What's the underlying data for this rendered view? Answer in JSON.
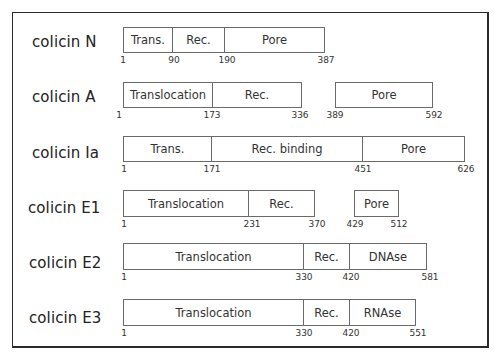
{
  "figure": {
    "rows": [
      {
        "label": "colicin N",
        "label_pos": {
          "x": 32,
          "y": 33
        },
        "box_top": 27,
        "box_height": 26,
        "segments": [
          {
            "label": "Trans.",
            "x": 123,
            "w": 50
          },
          {
            "label": "Rec.",
            "x": 172,
            "w": 53
          },
          {
            "label": "Pore",
            "x": 224,
            "w": 101
          }
        ],
        "ticks": [
          {
            "text": "1",
            "x": 123
          },
          {
            "text": "90",
            "x": 174
          },
          {
            "text": "190",
            "x": 227
          },
          {
            "text": "387",
            "x": 326
          }
        ]
      },
      {
        "label": "colicin A",
        "label_pos": {
          "x": 32,
          "y": 88
        },
        "box_top": 82,
        "box_height": 26,
        "segments": [
          {
            "label": "Translocation",
            "x": 123,
            "w": 90
          },
          {
            "label": "Rec.",
            "x": 212,
            "w": 90
          },
          {
            "label": "Pore",
            "x": 335,
            "w": 98
          }
        ],
        "ticks": [
          {
            "text": "1",
            "x": 119
          },
          {
            "text": "173",
            "x": 212
          },
          {
            "text": "336",
            "x": 300
          },
          {
            "text": "389",
            "x": 335
          },
          {
            "text": "592",
            "x": 434
          }
        ]
      },
      {
        "label": "colicin Ia",
        "label_pos": {
          "x": 32,
          "y": 144
        },
        "box_top": 136,
        "box_height": 26,
        "segments": [
          {
            "label": "Trans.",
            "x": 123,
            "w": 89
          },
          {
            "label": "Rec. binding",
            "x": 211,
            "w": 152
          },
          {
            "label": "Pore",
            "x": 362,
            "w": 103
          }
        ],
        "ticks": [
          {
            "text": "1",
            "x": 124
          },
          {
            "text": "171",
            "x": 212
          },
          {
            "text": "451",
            "x": 363
          },
          {
            "text": "626",
            "x": 466
          }
        ]
      },
      {
        "label": "colicin E1",
        "label_pos": {
          "x": 28,
          "y": 199
        },
        "box_top": 190,
        "box_height": 27,
        "segments": [
          {
            "label": "Translocation",
            "x": 123,
            "w": 126
          },
          {
            "label": "Rec.",
            "x": 248,
            "w": 67
          },
          {
            "label": "Pore",
            "x": 354,
            "w": 45
          }
        ],
        "ticks": [
          {
            "text": "1",
            "x": 124
          },
          {
            "text": "231",
            "x": 252
          },
          {
            "text": "370",
            "x": 317
          },
          {
            "text": "429",
            "x": 355
          },
          {
            "text": "512",
            "x": 399
          }
        ]
      },
      {
        "label": "colicin E2",
        "label_pos": {
          "x": 29,
          "y": 254
        },
        "box_top": 243,
        "box_height": 27,
        "segments": [
          {
            "label": "Translocation",
            "x": 123,
            "w": 181
          },
          {
            "label": "Rec.",
            "x": 303,
            "w": 47
          },
          {
            "label": "DNAse",
            "x": 349,
            "w": 78
          }
        ],
        "ticks": [
          {
            "text": "1",
            "x": 124
          },
          {
            "text": "330",
            "x": 304
          },
          {
            "text": "420",
            "x": 351
          },
          {
            "text": "581",
            "x": 430
          }
        ]
      },
      {
        "label": "colicin E3",
        "label_pos": {
          "x": 29,
          "y": 309
        },
        "box_top": 299,
        "box_height": 27,
        "segments": [
          {
            "label": "Translocation",
            "x": 123,
            "w": 181
          },
          {
            "label": "Rec.",
            "x": 303,
            "w": 47
          },
          {
            "label": "RNAse",
            "x": 349,
            "w": 67
          }
        ],
        "ticks": [
          {
            "text": "1",
            "x": 124
          },
          {
            "text": "330",
            "x": 304
          },
          {
            "text": "420",
            "x": 351
          },
          {
            "text": "551",
            "x": 418
          }
        ]
      }
    ]
  }
}
